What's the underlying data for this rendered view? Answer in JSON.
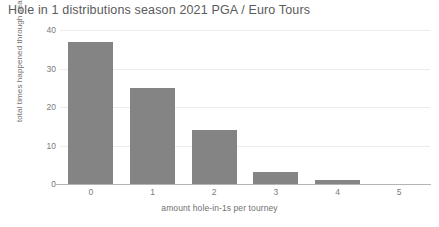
{
  "chart_data": {
    "type": "bar",
    "title": "Hole in 1 distributions season 2021 PGA / Euro Tours",
    "xlabel": "amount hole-in-1s per tourney",
    "ylabel": "total times happened through season",
    "categories": [
      "0",
      "1",
      "2",
      "3",
      "4",
      "5"
    ],
    "values": [
      37,
      25,
      14,
      3,
      1,
      0
    ],
    "ylim": [
      0,
      40
    ],
    "yticks": [
      "0",
      "10",
      "20",
      "30",
      "40"
    ],
    "ytick_values": [
      0,
      10,
      20,
      30,
      40
    ],
    "grid": "horizontal",
    "legend": "none",
    "bar_color": "#848484",
    "grid_color": "#ececec",
    "text_color": "#7a7a7a",
    "title_color": "#5a5a5a",
    "background": "#ffffff"
  }
}
